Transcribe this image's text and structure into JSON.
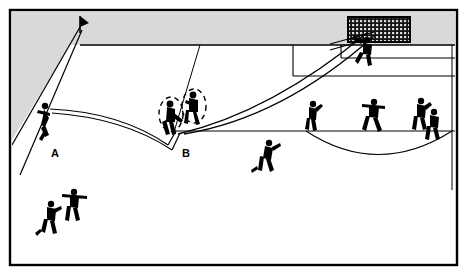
{
  "figure": {
    "kind": "soccer-tactical-diagram",
    "title": "",
    "width": 467,
    "height": 275,
    "background_color": "#ffffff",
    "border_color": "#000000",
    "out_of_bounds_color": "#d9d9d9",
    "line_color": "#000000",
    "player_color": "#000000",
    "net_color": "#1a1a1a"
  },
  "labels": [
    {
      "id": "label-a",
      "text": "A",
      "x": 55,
      "y": 155,
      "meaning": "position-a"
    },
    {
      "id": "label-b",
      "text": "B",
      "x": 186,
      "y": 155,
      "meaning": "position-b"
    }
  ],
  "field": {
    "border": {
      "x": 9,
      "y": 9,
      "width": 449,
      "height": 257
    },
    "out_of_bounds_band": {
      "x": 12,
      "y": 12,
      "width": 443,
      "height": 33
    },
    "goal_line_y": 45,
    "touchline_top_corner": {
      "x": 80,
      "y": 27
    },
    "penalty_box": {
      "left_x": 292,
      "top_y": 45,
      "right_x": 455,
      "bottom_y": 75
    },
    "six_yard_box": {
      "left_x": 340,
      "top_y": 45,
      "right_x": 455,
      "bottom_y": 58
    },
    "eighteen_line_y": 131,
    "penalty_arc": {
      "cx": 378,
      "cy": 131,
      "rx": 72,
      "ry": 22
    },
    "goal": {
      "x": 348,
      "y": 17,
      "width": 62,
      "height": 25
    }
  },
  "trajectories": [
    {
      "id": "pass-a-to-b",
      "from": "A",
      "to": "B",
      "style": "double-line-arc",
      "description": "Cross from A curving down to B"
    },
    {
      "id": "shot-b-to-goal",
      "from": "B",
      "to": "goal",
      "style": "double-line-arc",
      "description": "Rising shot from B into the goal"
    }
  ],
  "players": [
    {
      "id": "player-a-kicker",
      "x": 45,
      "y": 118,
      "role": "kicker-at-a",
      "pose": "kicking",
      "highlight": false
    },
    {
      "id": "player-b-front",
      "x": 172,
      "y": 120,
      "role": "attacker-at-b",
      "pose": "striking",
      "highlight": true
    },
    {
      "id": "player-b-back",
      "x": 192,
      "y": 110,
      "role": "attacker-at-b-support",
      "pose": "jumping",
      "highlight": true
    },
    {
      "id": "player-runner-mid",
      "x": 265,
      "y": 155,
      "role": "supporting-runner",
      "pose": "running",
      "highlight": false
    },
    {
      "id": "player-defender-1",
      "x": 312,
      "y": 115,
      "role": "defender",
      "pose": "standing",
      "highlight": false
    },
    {
      "id": "player-defender-2",
      "x": 372,
      "y": 113,
      "role": "defender",
      "pose": "arms-out",
      "highlight": false
    },
    {
      "id": "player-defender-3",
      "x": 421,
      "y": 113,
      "role": "defender",
      "pose": "standing",
      "highlight": false
    },
    {
      "id": "player-defender-4",
      "x": 432,
      "y": 124,
      "role": "defender",
      "pose": "standing",
      "highlight": false
    },
    {
      "id": "player-keeper",
      "x": 365,
      "y": 48,
      "role": "goalkeeper",
      "pose": "diving",
      "highlight": false
    },
    {
      "id": "player-bottom-1",
      "x": 50,
      "y": 215,
      "role": "teammate",
      "pose": "running",
      "highlight": false
    },
    {
      "id": "player-bottom-2",
      "x": 73,
      "y": 205,
      "role": "teammate",
      "pose": "arms-out",
      "highlight": false
    }
  ],
  "movement_markers": [
    {
      "id": "dashed-ellipse-b-front",
      "cx": 172,
      "cy": 116,
      "rx": 13,
      "ry": 17
    },
    {
      "id": "dashed-ellipse-b-back",
      "cx": 193,
      "cy": 108,
      "rx": 13,
      "ry": 17
    }
  ]
}
